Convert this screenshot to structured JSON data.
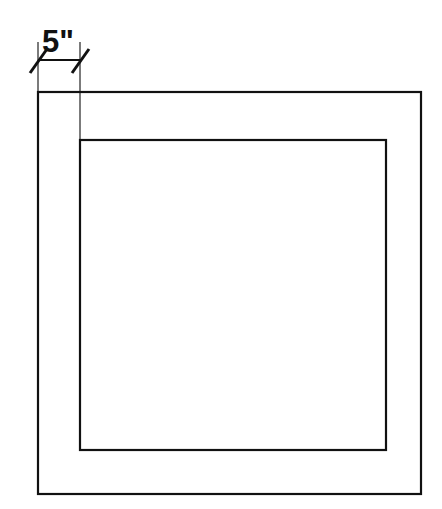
{
  "drawing": {
    "title": "Square frame cross-section with border width dimension",
    "canvas": {
      "width": 442,
      "height": 509,
      "background": "#ffffff"
    },
    "ink_color": "#111111",
    "shapes": {
      "outer_rectangle": {
        "name": "outer-square",
        "x": 38,
        "y": 92,
        "width": 383,
        "height": 402,
        "stroke_width": 2.2,
        "fill": "none"
      },
      "inner_rectangle": {
        "name": "inner-square",
        "x": 80,
        "y": 140,
        "width": 306,
        "height": 310,
        "stroke_width": 2.2,
        "fill": "none"
      }
    },
    "dimension": {
      "label": "5\"",
      "value": 5,
      "unit": "inches",
      "unit_symbol": "\"",
      "measures": "border width between outer and inner square (left side)",
      "line_y": 60,
      "start_x": 38,
      "end_x": 80,
      "terminator_style": "oblique-tick",
      "text_x": 42,
      "text_y": 52,
      "extension_lines": [
        {
          "name": "extension-line-left",
          "x": 38,
          "y_top": 42,
          "y_bottom": 92
        },
        {
          "name": "extension-line-right",
          "x": 80,
          "y_top": 42,
          "y_bottom": 140
        }
      ],
      "ticks": [
        {
          "name": "dim-tick-left",
          "x1": 30,
          "y1": 73,
          "x2": 47,
          "y2": 49
        },
        {
          "name": "dim-tick-right",
          "x1": 72,
          "y1": 73,
          "x2": 89,
          "y2": 49
        }
      ]
    }
  }
}
